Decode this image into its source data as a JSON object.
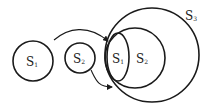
{
  "diagram": {
    "stroke_color": "#1a1a1a",
    "background": "#ffffff",
    "standalone": [
      {
        "id": "s1",
        "label": "S",
        "subscript": "1",
        "shape": "circle",
        "cx": 33,
        "cy": 61,
        "r": 20
      },
      {
        "id": "s2",
        "label": "S",
        "subscript": "2",
        "shape": "circle",
        "cx": 80,
        "cy": 58,
        "r": 15
      }
    ],
    "nested": [
      {
        "id": "s3-outer",
        "label": "S",
        "subscript": "3",
        "shape": "circle",
        "cx": 152,
        "cy": 55,
        "r": 47
      },
      {
        "id": "s2-middle",
        "label": "S",
        "subscript": "2",
        "shape": "circle",
        "cx": 135,
        "cy": 58,
        "r": 30
      },
      {
        "id": "s1-inner",
        "label": "S",
        "subscript": "1",
        "shape": "ellipse",
        "cx": 118,
        "cy": 57,
        "rx": 11,
        "ry": 24
      }
    ],
    "arrows": [
      {
        "from": "s1",
        "to": "s1-inner"
      },
      {
        "from": "s2",
        "to": "s1-inner"
      }
    ]
  }
}
